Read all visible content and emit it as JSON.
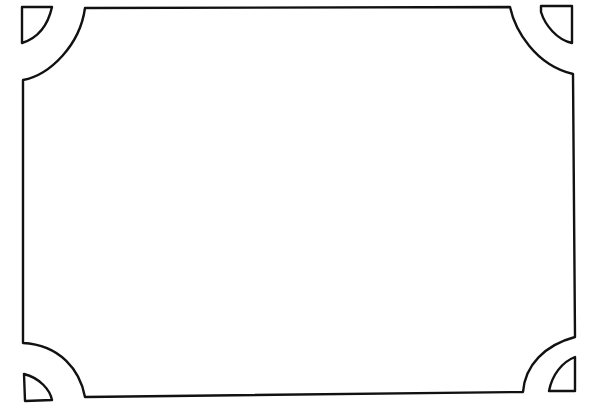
{
  "canvas": {
    "width": 596,
    "height": 415,
    "background": "#ffffff"
  },
  "style": {
    "stroke_color": "#111111",
    "stroke_width": 2.4
  },
  "frame": {
    "description": "rectangular border with concave quarter-circle notched corners",
    "left": 23,
    "right": 573,
    "top": 8,
    "bottom": 397
  },
  "corner_ornaments": [
    {
      "position": "top-left",
      "shape": "quarter-circle"
    },
    {
      "position": "top-right",
      "shape": "quarter-circle"
    },
    {
      "position": "bottom-left",
      "shape": "quarter-circle"
    },
    {
      "position": "bottom-right",
      "shape": "quarter-circle"
    }
  ],
  "content": {
    "text": ""
  }
}
